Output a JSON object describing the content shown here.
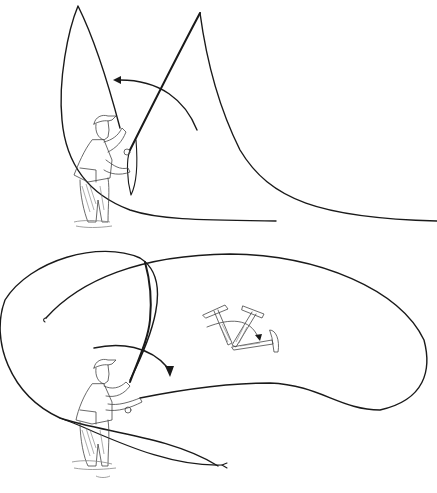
{
  "illustration": {
    "subject": "Fly casting technique illustration",
    "panels": [
      {
        "name": "back-cast",
        "description": "Angler wading, rod raised, line loop forming above and behind with arrow showing rod motion"
      },
      {
        "name": "forward-cast",
        "description": "Angler wading, rod driving forward with curved arrow; large line loop; hammer-stroke analogy inset"
      }
    ],
    "inset": {
      "name": "hammer-analogy",
      "description": "Three hammer positions showing wrist/forearm stroke with arrow"
    }
  },
  "colors": {
    "background": "#ffffff",
    "ink": "#1a1a1a",
    "shading": "#777777"
  }
}
